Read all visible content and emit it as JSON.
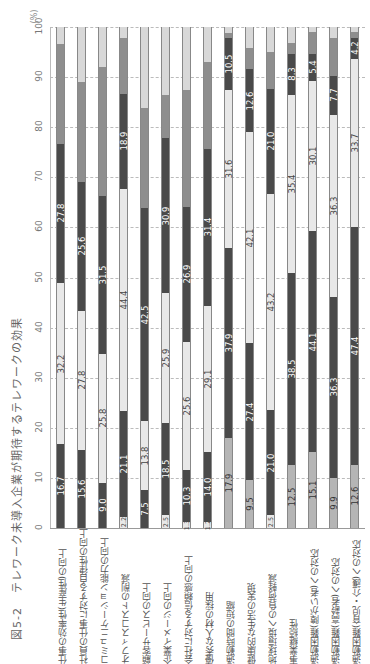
{
  "title": {
    "figure_no": "図5-2",
    "text": "テレワーク未導入企業が期待するテレワークの効果"
  },
  "chart_data": {
    "type": "bar",
    "stacked": true,
    "orientation": "vertical (image rotated 90°)",
    "title": "テレワーク未導入企業が期待するテレワークの効果",
    "ylabel": "(%)",
    "ylim": [
      0,
      100
    ],
    "yticks": [
      0,
      10,
      20,
      30,
      40,
      50,
      60,
      70,
      80,
      90,
      100
    ],
    "grid": true,
    "categories": [
      "仕事の効率性(生産性)の向上",
      "社員の仕事に対する自律性の向上",
      "コミュニケーション能力の向上",
      "オフィスコストの削減",
      "顧客サービスの向上",
      "企業イメージの向上",
      "会社に対する信頼感の向上",
      "優秀な人材の採用",
      "通勤時間の短縮",
      "健康的な生活の実現",
      "地球環境への負荷軽減",
      "事業継続性",
      "通勤困難(障がい者)への対応",
      "通勤困難(高齢者)への対応",
      "通勤困難(育児・介護)への対応"
    ],
    "bars": [
      {
        "segments": [
          {
            "v": 16.7,
            "c": "dark",
            "label": "16.7"
          },
          {
            "v": 32.2,
            "c": "light",
            "label": "32.2"
          },
          {
            "v": 27.8,
            "c": "dark",
            "label": "27.8"
          },
          {
            "v": 20.0,
            "c": "mid",
            "label": ""
          },
          {
            "v": 3.3,
            "c": "pale",
            "label": ""
          }
        ]
      },
      {
        "segments": [
          {
            "v": 15.6,
            "c": "dark",
            "label": "15.6"
          },
          {
            "v": 27.8,
            "c": "light",
            "label": "27.8"
          },
          {
            "v": 25.6,
            "c": "dark",
            "label": "25.6"
          },
          {
            "v": 20.0,
            "c": "mid",
            "label": ""
          },
          {
            "v": 11.0,
            "c": "pale",
            "label": ""
          }
        ]
      },
      {
        "segments": [
          {
            "v": 9.0,
            "c": "dark",
            "label": "9.0"
          },
          {
            "v": 25.8,
            "c": "light",
            "label": "25.8"
          },
          {
            "v": 31.5,
            "c": "dark",
            "label": "31.5"
          },
          {
            "v": 25.8,
            "c": "mid",
            "label": ""
          },
          {
            "v": 7.9,
            "c": "pale",
            "label": ""
          }
        ]
      },
      {
        "segments": [
          {
            "v": 2.2,
            "c": "light",
            "label": "2.2"
          },
          {
            "v": 21.1,
            "c": "dark",
            "label": "21.1"
          },
          {
            "v": 44.4,
            "c": "light",
            "label": "44.4"
          },
          {
            "v": 18.9,
            "c": "dark",
            "label": "18.9"
          },
          {
            "v": 11.3,
            "c": "mid",
            "label": ""
          },
          {
            "v": 2.1,
            "c": "pale",
            "label": ""
          }
        ]
      },
      {
        "segments": [
          {
            "v": 7.5,
            "c": "dark",
            "label": "7.5"
          },
          {
            "v": 13.8,
            "c": "light",
            "label": "13.8"
          },
          {
            "v": 42.5,
            "c": "dark",
            "label": "42.5"
          },
          {
            "v": 20.0,
            "c": "mid",
            "label": ""
          },
          {
            "v": 16.2,
            "c": "pale",
            "label": ""
          }
        ]
      },
      {
        "segments": [
          {
            "v": 2.5,
            "c": "light",
            "label": "2.5"
          },
          {
            "v": 18.5,
            "c": "dark",
            "label": "18.5"
          },
          {
            "v": 25.9,
            "c": "light",
            "label": "25.9"
          },
          {
            "v": 30.9,
            "c": "dark",
            "label": "30.9"
          },
          {
            "v": 8.7,
            "c": "mid",
            "label": ""
          },
          {
            "v": 13.5,
            "c": "pale",
            "label": ""
          }
        ]
      },
      {
        "segments": [
          {
            "v": 1.3,
            "c": "light",
            "label": "1.3"
          },
          {
            "v": 10.3,
            "c": "dark",
            "label": "10.3"
          },
          {
            "v": 25.6,
            "c": "light",
            "label": "25.6"
          },
          {
            "v": 26.9,
            "c": "dark",
            "label": "26.9"
          },
          {
            "v": 23.4,
            "c": "mid",
            "label": ""
          },
          {
            "v": 12.5,
            "c": "pale",
            "label": ""
          }
        ]
      },
      {
        "segments": [
          {
            "v": 1.2,
            "c": "light",
            "label": "1.2"
          },
          {
            "v": 14.0,
            "c": "dark",
            "label": "14.0"
          },
          {
            "v": 29.1,
            "c": "light",
            "label": "29.1"
          },
          {
            "v": 31.4,
            "c": "dark",
            "label": "31.4"
          },
          {
            "v": 17.3,
            "c": "mid",
            "label": ""
          },
          {
            "v": 7.0,
            "c": "pale",
            "label": ""
          }
        ]
      },
      {
        "segments": [
          {
            "v": 17.9,
            "c": "gray",
            "label": "17.9"
          },
          {
            "v": 37.9,
            "c": "dark",
            "label": "37.9"
          },
          {
            "v": 31.6,
            "c": "light",
            "label": "31.6"
          },
          {
            "v": 10.5,
            "c": "dark",
            "label": "10.5"
          },
          {
            "v": 1.0,
            "c": "mid",
            "label": ""
          },
          {
            "v": 1.1,
            "c": "pale",
            "label": ""
          }
        ]
      },
      {
        "segments": [
          {
            "v": 9.5,
            "c": "gray",
            "label": "9.5"
          },
          {
            "v": 27.4,
            "c": "dark",
            "label": "27.4"
          },
          {
            "v": 42.1,
            "c": "light",
            "label": "42.1"
          },
          {
            "v": 12.6,
            "c": "dark",
            "label": "12.6"
          },
          {
            "v": 4.2,
            "c": "mid",
            "label": ""
          },
          {
            "v": 4.2,
            "c": "pale",
            "label": ""
          }
        ]
      },
      {
        "segments": [
          {
            "v": 2.5,
            "c": "light",
            "label": "2.5"
          },
          {
            "v": 21.0,
            "c": "dark",
            "label": "21.0"
          },
          {
            "v": 43.2,
            "c": "light",
            "label": "43.2"
          },
          {
            "v": 21.0,
            "c": "dark",
            "label": "21.0"
          },
          {
            "v": 7.3,
            "c": "mid",
            "label": ""
          },
          {
            "v": 5.0,
            "c": "pale",
            "label": ""
          }
        ]
      },
      {
        "segments": [
          {
            "v": 12.5,
            "c": "gray",
            "label": "12.5"
          },
          {
            "v": 38.5,
            "c": "dark",
            "label": "38.5"
          },
          {
            "v": 35.4,
            "c": "light",
            "label": "35.4"
          },
          {
            "v": 8.3,
            "c": "dark",
            "label": "8.3"
          },
          {
            "v": 2.1,
            "c": "mid",
            "label": ""
          },
          {
            "v": 3.2,
            "c": "pale",
            "label": ""
          }
        ]
      },
      {
        "segments": [
          {
            "v": 15.1,
            "c": "gray",
            "label": "15.1"
          },
          {
            "v": 44.1,
            "c": "dark",
            "label": "44.1"
          },
          {
            "v": 30.1,
            "c": "light",
            "label": "30.1"
          },
          {
            "v": 5.4,
            "c": "dark",
            "label": "5.4"
          },
          {
            "v": 4.3,
            "c": "mid",
            "label": ""
          },
          {
            "v": 1.0,
            "c": "pale",
            "label": ""
          }
        ]
      },
      {
        "segments": [
          {
            "v": 9.9,
            "c": "gray",
            "label": "9.9"
          },
          {
            "v": 36.3,
            "c": "dark",
            "label": "36.3"
          },
          {
            "v": 36.3,
            "c": "light",
            "label": "36.3"
          },
          {
            "v": 7.7,
            "c": "dark",
            "label": "7.7"
          },
          {
            "v": 7.6,
            "c": "mid",
            "label": ""
          },
          {
            "v": 2.2,
            "c": "pale",
            "label": ""
          }
        ]
      },
      {
        "segments": [
          {
            "v": 12.6,
            "c": "gray",
            "label": "12.6"
          },
          {
            "v": 47.4,
            "c": "dark",
            "label": "47.4"
          },
          {
            "v": 33.7,
            "c": "light",
            "label": "33.7"
          },
          {
            "v": 4.2,
            "c": "dark",
            "label": "4.2"
          },
          {
            "v": 1.1,
            "c": "mid",
            "label": ""
          },
          {
            "v": 1.0,
            "c": "pale",
            "label": ""
          }
        ]
      }
    ],
    "colors": {
      "dark": "#4a4a4a",
      "light": "#e8e8e8",
      "mid": "#8e8e8e",
      "pale": "#d8d8d8",
      "gray": "#b5b5b5"
    }
  }
}
